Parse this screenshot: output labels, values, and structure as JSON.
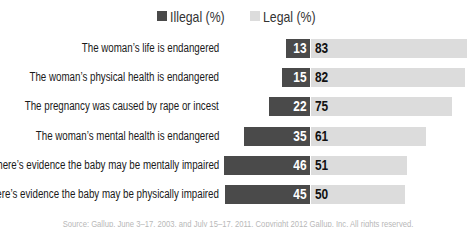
{
  "legend": {
    "illegal_label": "Illegal (%)",
    "legal_label": "Legal (%)",
    "illegal_color": "#4a4a4a",
    "legal_color": "#dcdcdc"
  },
  "rows": [
    {
      "label": "The woman’s life is endangered",
      "illegal": "13",
      "legal": "83"
    },
    {
      "label": "The woman’s physical health is endangered",
      "illegal": "15",
      "legal": "82"
    },
    {
      "label": "The pregnancy was caused by rape or incest",
      "illegal": "22",
      "legal": "75"
    },
    {
      "label": "The woman’s mental health is endangered",
      "illegal": "35",
      "legal": "61"
    },
    {
      "label": "There’s evidence the baby may be mentally impaired",
      "illegal": "46",
      "legal": "51"
    },
    {
      "label": "There’s evidence the baby may be physically impaired",
      "illegal": "45",
      "legal": "50"
    }
  ],
  "footer": "Source: Gallup, June 3–17, 2003, and July 15–17, 2011. Copyright 2012 Gallup, Inc. All rights reserved.",
  "chart_data": {
    "type": "bar",
    "orientation": "horizontal",
    "stacked": "diverging",
    "title": "",
    "categories": [
      "The woman’s life is endangered",
      "The woman’s physical health is endangered",
      "The pregnancy was caused by rape or incest",
      "The woman’s mental health is endangered",
      "There’s evidence the baby may be mentally impaired",
      "There’s evidence the baby may be physically impaired"
    ],
    "series": [
      {
        "name": "Illegal (%)",
        "color": "#4a4a4a",
        "values": [
          13,
          15,
          22,
          35,
          46,
          45
        ]
      },
      {
        "name": "Legal (%)",
        "color": "#dcdcdc",
        "values": [
          83,
          82,
          75,
          61,
          51,
          50
        ]
      }
    ],
    "xlabel": "",
    "ylabel": "",
    "grid": false,
    "legend_position": "top",
    "data_labels": true
  }
}
